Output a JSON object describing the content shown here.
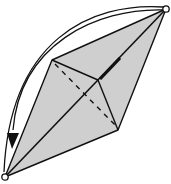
{
  "diagram": {
    "type": "origami-fold-step",
    "colors": {
      "paper_fill": "#cfcfcf",
      "line": "#111111",
      "background": "#ffffff",
      "point_marker_fill": "#ffffff"
    },
    "points": {
      "top_right_corner": [
        166,
        9
      ],
      "bottom_left_corner": [
        5,
        177
      ],
      "left_vertex": [
        52,
        60
      ],
      "right_vertex": [
        118,
        130
      ],
      "center": [
        98,
        80
      ]
    },
    "lines": {
      "solid": [
        "outer-edges",
        "diagonal",
        "upper-crease",
        "lower-crease"
      ],
      "dashed": [
        "valley-fold-line"
      ]
    },
    "arrow": {
      "kind": "fold-arrow",
      "from": "top_right_corner",
      "to": "bottom_left_corner",
      "direction": "counter-clockwise"
    },
    "markers": [
      "top-right-circle",
      "bottom-left-circle"
    ]
  }
}
